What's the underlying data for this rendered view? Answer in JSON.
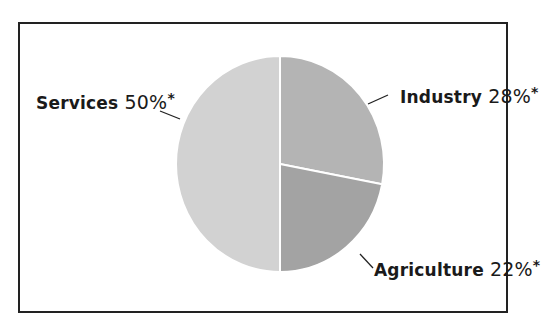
{
  "chart_data": {
    "type": "pie",
    "title": "",
    "categories": [
      "Industry",
      "Agriculture",
      "Services"
    ],
    "values": [
      28,
      22,
      50
    ],
    "unit": "%",
    "footnote_marker": "*",
    "colors": [
      "#b4b4b4",
      "#a3a3a3",
      "#d2d2d2"
    ],
    "labels": [
      {
        "name": "Industry",
        "value": "28%",
        "marker": "*"
      },
      {
        "name": "Agriculture",
        "value": "22%",
        "marker": "*"
      },
      {
        "name": "Services",
        "value": "50%",
        "marker": "*"
      }
    ],
    "start_angle_deg": 0,
    "direction": "clockwise",
    "legend": "none (direct labels with leader lines)"
  }
}
